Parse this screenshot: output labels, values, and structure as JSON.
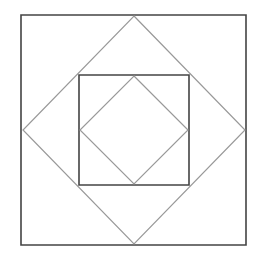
{
  "diagram": {
    "type": "nested-squares-and-diamonds",
    "width": 260,
    "height": 256,
    "background": "#ffffff",
    "colors": {
      "square_stroke": "#444444",
      "diamond_stroke": "#999999"
    },
    "stroke_widths": {
      "square": 1.6,
      "diamond": 1.2
    },
    "shapes": [
      {
        "name": "outer-square",
        "kind": "square",
        "points": [
          [
            21,
            15
          ],
          [
            246,
            15
          ],
          [
            246,
            245
          ],
          [
            21,
            245
          ]
        ]
      },
      {
        "name": "outer-diamond",
        "kind": "diamond",
        "points": [
          [
            134,
            16
          ],
          [
            245,
            130
          ],
          [
            134,
            244
          ],
          [
            23,
            130
          ]
        ]
      },
      {
        "name": "inner-square",
        "kind": "square",
        "points": [
          [
            79,
            75
          ],
          [
            189,
            75
          ],
          [
            189,
            185
          ],
          [
            79,
            185
          ]
        ]
      },
      {
        "name": "inner-diamond",
        "kind": "diamond",
        "points": [
          [
            134,
            76
          ],
          [
            188,
            130
          ],
          [
            134,
            184
          ],
          [
            80,
            130
          ]
        ]
      }
    ]
  }
}
